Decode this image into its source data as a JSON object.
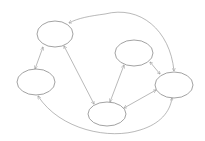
{
  "diagram": {
    "type": "directed-graph",
    "background": "#ffffff",
    "stroke_color": "#8a8a8a",
    "nodes": [
      {
        "id": "A",
        "label": "",
        "cx": 55,
        "cy": 34,
        "rx": 18,
        "ry": 13
      },
      {
        "id": "B",
        "label": "",
        "cx": 36,
        "cy": 82,
        "rx": 19,
        "ry": 13
      },
      {
        "id": "C",
        "label": "",
        "cx": 134,
        "cy": 53,
        "rx": 19,
        "ry": 13
      },
      {
        "id": "D",
        "label": "",
        "cx": 174,
        "cy": 85,
        "rx": 19,
        "ry": 13
      },
      {
        "id": "E",
        "label": "",
        "cx": 107,
        "cy": 114,
        "rx": 19,
        "ry": 12
      }
    ],
    "edges": [
      {
        "from": "A",
        "to": "B",
        "bidirectional": true
      },
      {
        "from": "A",
        "to": "E",
        "bidirectional": true
      },
      {
        "from": "C",
        "to": "E",
        "bidirectional": true
      },
      {
        "from": "C",
        "to": "D",
        "bidirectional": true
      },
      {
        "from": "E",
        "to": "D",
        "bidirectional": true
      },
      {
        "from": "D",
        "to": "A",
        "bidirectional": true,
        "curved": "top"
      },
      {
        "from": "B",
        "to": "D",
        "bidirectional": true,
        "curved": "bottom"
      }
    ]
  }
}
